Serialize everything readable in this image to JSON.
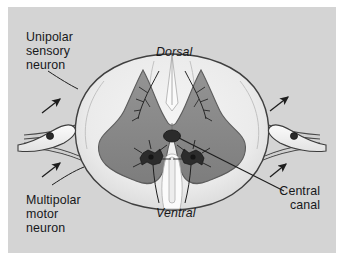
{
  "figure": {
    "plate_background": "#d4d4d4",
    "border_color": "#ffffff"
  },
  "labels": {
    "unipolar_sensory_neuron": "Unipolar\nsensory\nneuron",
    "multipolar_motor_neuron": "Multipolar\nmotor\nneuron",
    "dorsal": "Dorsal",
    "ventral": "Ventral",
    "central_canal": "Central\ncanal"
  },
  "anatomy": {
    "white_matter_label": "white-matter",
    "gray_matter_label": "gray-matter",
    "central_canal_label": "central-canal",
    "dorsal_fissure_label": "dorsal-median-fissure",
    "ventral_fissure_label": "ventral-median-fissure",
    "dorsal_root_ganglion_label": "dorsal-root-ganglion",
    "motor_neuron_label": "multipolar-motor-neuron-soma",
    "sensory_fiber_label": "sensory-nerve-fiber",
    "motor_fiber_label": "motor-nerve-fiber"
  },
  "colors": {
    "plate": "#d4d4d4",
    "white_matter": "#ededed",
    "white_matter_shade": "#dcdcdc",
    "gray_matter": "#8d8d8d",
    "gray_matter_shade": "#7b7b7b",
    "outline": "#3c3c3c",
    "nerve_fill": "#f3f3f3",
    "text": "#17181a",
    "canal": "#2e2e2e"
  },
  "arrows": [
    {
      "name": "left-sensory-arrow-up",
      "direction": "up-right"
    },
    {
      "name": "left-motor-arrow-up",
      "direction": "up-right"
    },
    {
      "name": "right-sensory-arrow-up",
      "direction": "up-right"
    },
    {
      "name": "right-motor-arrow-up",
      "direction": "up-right"
    }
  ]
}
